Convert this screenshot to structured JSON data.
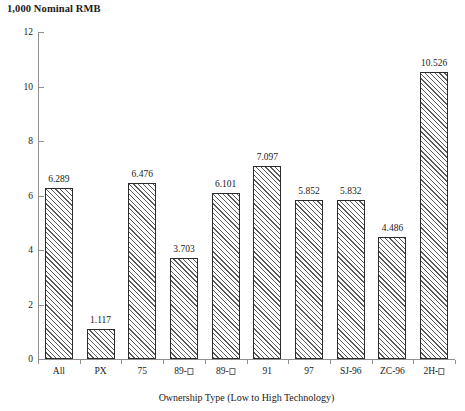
{
  "chart_data": {
    "type": "bar",
    "title": "1,000 Nominal RMB",
    "xlabel": "Ownership Type (Low to High Technology)",
    "ylabel": "1,000 Nominal RMB",
    "categories": [
      "All",
      "PX",
      "75",
      "89-□",
      "89-□",
      "91",
      "97",
      "SJ-96",
      "ZC-96",
      "2H-□"
    ],
    "values": [
      6.289,
      1.117,
      6.476,
      3.703,
      6.101,
      7.097,
      5.852,
      5.832,
      4.486,
      10.526
    ],
    "value_labels": [
      "6.289",
      "1.117",
      "6.476",
      "3.703",
      "6.101",
      "7.097",
      "5.852",
      "5.832",
      "4.486",
      "10.526"
    ],
    "ylim": [
      0,
      12
    ],
    "yticks": [
      0,
      2,
      4,
      6,
      8,
      10,
      12
    ],
    "ytick_labels": [
      "0",
      "2",
      "4",
      "6",
      "8",
      "10",
      "12"
    ],
    "grid": false,
    "legend": null,
    "bar_fill": "hatched-diagonal",
    "bar_edge_color": "#2b2b2b",
    "axis_color": "#8f8f8f",
    "text_color": "#1a1a1a"
  }
}
